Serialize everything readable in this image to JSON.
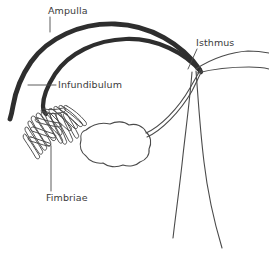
{
  "diagram": {
    "background_color": "#ffffff",
    "ink_color": "#2e2e2e",
    "line_color": "#4a4a4a",
    "text_color": "#3a3a3a",
    "width": 269,
    "height": 255,
    "labels": [
      {
        "id": "ampulla",
        "text": "Ampulla",
        "x": 48,
        "y": 14,
        "leader": "vertical"
      },
      {
        "id": "isthmus",
        "text": "Isthmus",
        "x": 196,
        "y": 46,
        "leader": "diagonal"
      },
      {
        "id": "infundibulum",
        "text": "Infundibulum",
        "x": 58,
        "y": 88,
        "leader": "horizontal"
      },
      {
        "id": "fimbriae",
        "text": "Fimbriae",
        "x": 46,
        "y": 201,
        "leader": "vertical"
      }
    ],
    "structures": [
      {
        "id": "ampulla-tube",
        "name": "ampulla",
        "stroke_width": 4.6
      },
      {
        "id": "isthmus-tube",
        "name": "isthmus",
        "stroke_width": 1.1
      },
      {
        "id": "ovary",
        "name": "ovary",
        "stroke_width": 1.1
      },
      {
        "id": "fimbriae-fringe",
        "name": "fimbriae",
        "count": 14
      },
      {
        "id": "uterus-wall",
        "name": "uterine-wall",
        "stroke_width": 1.1
      }
    ]
  }
}
